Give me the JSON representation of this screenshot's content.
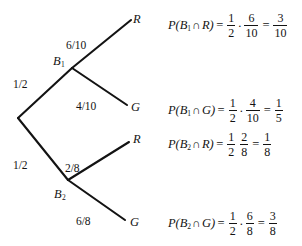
{
  "diagram": {
    "type": "probability-tree",
    "nodes": {
      "root": {
        "label": "",
        "x": 18,
        "y": 118
      },
      "b1": {
        "label": "B",
        "sub": "1",
        "x": 72,
        "y": 68
      },
      "b2": {
        "label": "B",
        "sub": "2",
        "x": 68,
        "y": 180
      }
    },
    "outcomes": {
      "r1": {
        "label": "R",
        "x": 133,
        "y": 18
      },
      "g1": {
        "label": "G",
        "x": 131,
        "y": 107
      },
      "r2": {
        "label": "R",
        "x": 133,
        "y": 139
      },
      "g2": {
        "label": "G",
        "x": 130,
        "y": 222
      }
    },
    "branch_probabilities": {
      "root_to_b1": "1/2",
      "root_to_b2": "1/2",
      "b1_to_r": "6/10",
      "b1_to_g": "4/10",
      "b2_to_r": "2/8",
      "b2_to_g": "6/8"
    }
  },
  "equations": [
    {
      "id": "p-b1-r",
      "lhs_p": "P",
      "lhs_open": "(",
      "lhs_var": "B",
      "lhs_sub": "1",
      "lhs_cap": "∩",
      "lhs_outcome": "R",
      "lhs_close": ")",
      "equals": "=",
      "f1_num": "1",
      "f1_den": "2",
      "dot": "·",
      "f2_num": "6",
      "f2_den": "10",
      "equals2": "=",
      "f3_num": "3",
      "f3_den": "10"
    },
    {
      "id": "p-b1-g",
      "lhs_p": "P",
      "lhs_open": "(",
      "lhs_var": "B",
      "lhs_sub": "1",
      "lhs_cap": "∩",
      "lhs_outcome": "G",
      "lhs_close": ")",
      "equals": "=",
      "f1_num": "1",
      "f1_den": "2",
      "dot": "·",
      "f2_num": "4",
      "f2_den": "10",
      "equals2": "=",
      "f3_num": "1",
      "f3_den": "5"
    },
    {
      "id": "p-b2-r",
      "lhs_p": "P",
      "lhs_open": "(",
      "lhs_var": "B",
      "lhs_sub": "2",
      "lhs_cap": "∩",
      "lhs_outcome": "R",
      "lhs_close": ")",
      "equals": "=",
      "f1_num": "1",
      "f1_den": "2",
      "dot": "",
      "f2_num": "2",
      "f2_den": "8",
      "equals2": "=",
      "f3_num": "1",
      "f3_den": "8"
    },
    {
      "id": "p-b2-g",
      "lhs_p": "P",
      "lhs_open": "(",
      "lhs_var": "B",
      "lhs_sub": "2",
      "lhs_cap": "∩",
      "lhs_outcome": "G",
      "lhs_close": ")",
      "equals": "=",
      "f1_num": "1",
      "f1_den": "2",
      "dot": "·",
      "f2_num": "6",
      "f2_den": "8",
      "equals2": "=",
      "f3_num": "3",
      "f3_den": "8"
    }
  ],
  "colors": {
    "ink": "#131313",
    "background": "#ffffff"
  }
}
